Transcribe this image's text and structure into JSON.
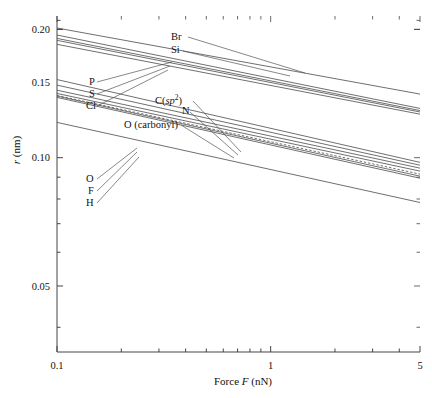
{
  "chart_data": {
    "type": "line",
    "title": "",
    "xlabel": "Force F (nN)",
    "ylabel": "r (nm)",
    "xscale": "log",
    "yscale": "log",
    "xlim": [
      0.1,
      5
    ],
    "ylim": [
      0.035,
      0.215
    ],
    "xticks": [
      0.1,
      1,
      5
    ],
    "xticklabels": [
      "0.1",
      "1",
      "5"
    ],
    "yticks": [
      0.05,
      0.1,
      0.15,
      0.2
    ],
    "yticklabels": [
      "0.05",
      "0.10",
      "0.15",
      "0.20"
    ],
    "grid": false,
    "legend": "inline-annotations",
    "x": [
      0.1,
      5
    ],
    "series": [
      {
        "name": "Br",
        "label": "Br",
        "values": [
          0.2015,
          0.141
        ],
        "style": "solid"
      },
      {
        "name": "Si",
        "label": "Si",
        "values": [
          0.194,
          0.1305
        ],
        "style": "solid"
      },
      {
        "name": "P",
        "label": "P",
        "values": [
          0.1905,
          0.129
        ],
        "style": "solid"
      },
      {
        "name": "S",
        "label": "S",
        "values": [
          0.1885,
          0.128
        ],
        "style": "solid"
      },
      {
        "name": "Cl",
        "label": "Cl",
        "values": [
          0.1845,
          0.1265
        ],
        "style": "solid"
      },
      {
        "name": "C(sp2)",
        "label": "C(sp²)",
        "values": [
          0.1525,
          0.0975
        ],
        "style": "solid"
      },
      {
        "name": "N",
        "label": "N",
        "values": [
          0.148,
          0.096
        ],
        "style": "solid"
      },
      {
        "name": "O (carbonyl)",
        "label": "O (carbonyl)",
        "values": [
          0.144,
          0.0945
        ],
        "style": "solid"
      },
      {
        "name": "O",
        "label": "O",
        "values": [
          0.1415,
          0.093
        ],
        "style": "solid"
      },
      {
        "name": "F",
        "label": "F",
        "values": [
          0.14,
          0.0915
        ],
        "style": "dashed"
      },
      {
        "name": "F2",
        "label": "F",
        "values": [
          0.1395,
          0.0905
        ],
        "style": "solid"
      },
      {
        "name": "H",
        "label": "H",
        "values": [
          0.1385,
          0.0895
        ],
        "style": "solid"
      },
      {
        "name": "H2",
        "label": "H",
        "values": [
          0.121,
          0.0785
        ],
        "style": "solid"
      }
    ],
    "annotations": [
      {
        "text": "Br",
        "x_px": 171,
        "y_px": 40
      },
      {
        "text": "Si",
        "x_px": 171,
        "y_px": 53
      },
      {
        "text": "P",
        "x_px": 89,
        "y_px": 85
      },
      {
        "text": "S",
        "x_px": 89,
        "y_px": 97
      },
      {
        "text": "Cl",
        "x_px": 86,
        "y_px": 109
      },
      {
        "text": "C(sp²)",
        "x_px": 155,
        "y_px": 104
      },
      {
        "text": "N",
        "x_px": 182,
        "y_px": 114
      },
      {
        "text": "O (carbonyl)",
        "x_px": 124,
        "y_px": 128
      },
      {
        "text": "O",
        "x_px": 86,
        "y_px": 182
      },
      {
        "text": "F",
        "x_px": 88,
        "y_px": 194
      },
      {
        "text": "H",
        "x_px": 86,
        "y_px": 206
      }
    ],
    "colors": {
      "line": "#555555",
      "axis": "#444444",
      "text": "#111111"
    }
  }
}
